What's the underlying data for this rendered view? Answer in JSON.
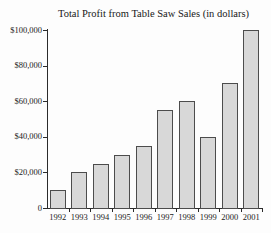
{
  "chart": {
    "title": "Total Profit from Table Saw Sales (in dollars)"
  },
  "chart_data": {
    "type": "bar",
    "title": "Total Profit from Table Saw Sales (in dollars)",
    "xlabel": "",
    "ylabel": "",
    "categories": [
      "1992",
      "1993",
      "1994",
      "1995",
      "1996",
      "1997",
      "1998",
      "1999",
      "2000",
      "2001"
    ],
    "values": [
      10000,
      20000,
      25000,
      30000,
      35000,
      55000,
      60000,
      40000,
      70000,
      100000
    ],
    "ylim": [
      0,
      100000
    ],
    "ytick_step": 20000,
    "ytick_labels": [
      "0",
      "$20,000",
      "$40,000",
      "$60,000",
      "$80,000",
      "$100,000"
    ],
    "grid": false,
    "legend": "none",
    "colors": {
      "bar_fill": "#d8d8d8",
      "bar_border": "#4c4c4c",
      "axis": "#2b2b2b",
      "text": "#1b1b1b",
      "background": "#fdfdfd"
    }
  }
}
